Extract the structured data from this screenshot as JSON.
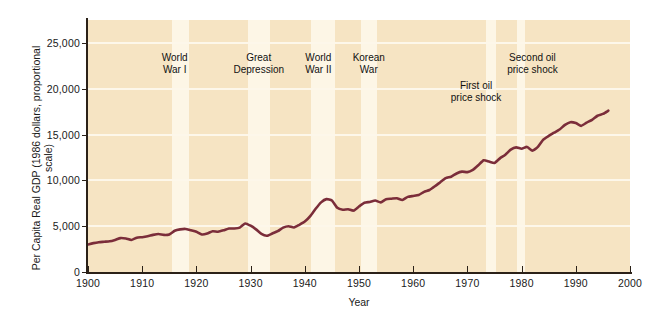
{
  "chart_data": {
    "type": "line",
    "title": "",
    "xlabel": "Year",
    "ylabel": "Per Capita Real GDP (1986 dollars, proportional scale)",
    "xlim": [
      1900,
      2000
    ],
    "ylim": [
      0,
      27500
    ],
    "grid": true,
    "legend": "none",
    "line_color": "#7b2d3a",
    "plot_background": "#f6e4c3",
    "band_color": "#fdf6e6",
    "gridline_color": "#fdf7ea",
    "xticks": [
      1900,
      1910,
      1920,
      1930,
      1940,
      1950,
      1960,
      1970,
      1980,
      1990,
      2000
    ],
    "xticklabels": [
      "1900",
      "1910",
      "1920",
      "1930",
      "1940",
      "1950",
      "1960",
      "1970",
      "1980",
      "1990",
      "2000"
    ],
    "yticks": [
      0,
      5000,
      10000,
      15000,
      20000,
      25000
    ],
    "yticklabels": [
      "0",
      "5,000",
      "10,000",
      "15,000",
      "20,000",
      "25,000"
    ],
    "series": [
      {
        "name": "Per Capita Real GDP",
        "x": [
          1900,
          1901,
          1902,
          1903,
          1904,
          1905,
          1906,
          1907,
          1908,
          1909,
          1910,
          1911,
          1912,
          1913,
          1914,
          1915,
          1916,
          1917,
          1918,
          1919,
          1920,
          1921,
          1922,
          1923,
          1924,
          1925,
          1926,
          1927,
          1928,
          1929,
          1930,
          1931,
          1932,
          1933,
          1934,
          1935,
          1936,
          1937,
          1938,
          1939,
          1940,
          1941,
          1942,
          1943,
          1944,
          1945,
          1946,
          1947,
          1948,
          1949,
          1950,
          1951,
          1952,
          1953,
          1954,
          1955,
          1956,
          1957,
          1958,
          1959,
          1960,
          1961,
          1962,
          1963,
          1964,
          1965,
          1966,
          1967,
          1968,
          1969,
          1970,
          1971,
          1972,
          1973,
          1974,
          1975,
          1976,
          1977,
          1978,
          1979,
          1980,
          1981,
          1982,
          1983,
          1984,
          1985,
          1986,
          1987,
          1988,
          1989,
          1990,
          1991,
          1992,
          1993,
          1994,
          1995,
          1996
        ],
        "values": [
          3000,
          3150,
          3250,
          3300,
          3350,
          3500,
          3700,
          3650,
          3500,
          3750,
          3800,
          3900,
          4050,
          4150,
          4050,
          4100,
          4500,
          4650,
          4700,
          4550,
          4400,
          4100,
          4200,
          4450,
          4400,
          4550,
          4750,
          4750,
          4850,
          5300,
          5050,
          4650,
          4150,
          3950,
          4200,
          4450,
          4850,
          5000,
          4850,
          5150,
          5500,
          6100,
          6900,
          7600,
          7950,
          7800,
          7000,
          6800,
          6850,
          6700,
          7150,
          7550,
          7650,
          7800,
          7600,
          7950,
          8000,
          8050,
          7850,
          8200,
          8300,
          8400,
          8750,
          8950,
          9350,
          9800,
          10250,
          10400,
          10750,
          10950,
          10900,
          11150,
          11650,
          12200,
          12050,
          11900,
          12400,
          12800,
          13350,
          13600,
          13450,
          13650,
          13250,
          13650,
          14450,
          14850,
          15200,
          15550,
          16050,
          16350,
          16250,
          15950,
          16300,
          16600,
          17050,
          17250,
          17600
        ]
      }
    ],
    "annotations": [
      {
        "label": "World\nWar I",
        "x_center": 1916,
        "era_start": 1915.5,
        "era_end": 1918.6
      },
      {
        "label": "Great\nDepression",
        "x_center": 1931.5,
        "era_start": 1929.5,
        "era_end": 1933.5
      },
      {
        "label": "World\nWar II",
        "x_center": 1942.5,
        "era_start": 1941.2,
        "era_end": 1945.6
      },
      {
        "label": "Korean\nWar",
        "x_center": 1951.8,
        "era_start": 1950.4,
        "era_end": 1953.4
      },
      {
        "label": "First oil\nprice shock",
        "x_center": 1971.6,
        "era_start": 1973.4,
        "era_end": 1975.2
      },
      {
        "label": "Second oil\nprice shock",
        "x_center": 1982.0,
        "era_start": 1979.2,
        "era_end": 1980.6
      }
    ]
  }
}
